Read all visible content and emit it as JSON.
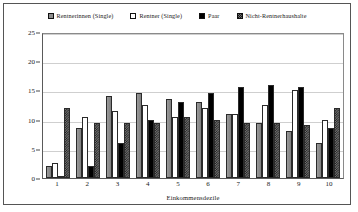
{
  "chart_data": {
    "type": "bar",
    "title": "",
    "xlabel": "Einkommensdezile",
    "ylabel": "",
    "categories": [
      "1",
      "2",
      "3",
      "4",
      "5",
      "6",
      "7",
      "8",
      "9",
      "10"
    ],
    "ylim": [
      0,
      25
    ],
    "yticks": [
      0,
      5,
      10,
      15,
      20,
      25
    ],
    "grid": true,
    "legend_position": "top-center",
    "series": [
      {
        "name": "Rentnerinnen (Single)",
        "pattern": "gray",
        "color": "#919191",
        "values": [
          2.0,
          8.5,
          14.0,
          14.5,
          13.5,
          13.0,
          11.0,
          9.5,
          8.0,
          6.0
        ]
      },
      {
        "name": "Rentner (Single)",
        "pattern": "white",
        "color": "#ffffff",
        "values": [
          2.5,
          10.5,
          11.5,
          12.5,
          10.5,
          12.0,
          11.0,
          12.5,
          15.0,
          10.0
        ]
      },
      {
        "name": "Paar",
        "pattern": "black",
        "color": "#000000",
        "values": [
          0.3,
          2.0,
          6.0,
          10.0,
          13.0,
          14.5,
          15.5,
          16.0,
          15.5,
          8.5
        ]
      },
      {
        "name": "Nicht-Rentnerhaushalte",
        "pattern": "checker",
        "color": "#707070",
        "values": [
          12.0,
          9.5,
          9.5,
          9.5,
          10.5,
          10.0,
          9.5,
          9.5,
          9.0,
          12.0
        ]
      }
    ]
  },
  "legend": {
    "items": [
      {
        "label": "Rentnerinnen (Single)",
        "swatch": "gray"
      },
      {
        "label": "Rentner (Single)",
        "swatch": "white"
      },
      {
        "label": "Paar",
        "swatch": "black"
      },
      {
        "label": "Nicht-Rentnerhaushalte",
        "swatch": "checker"
      }
    ]
  }
}
